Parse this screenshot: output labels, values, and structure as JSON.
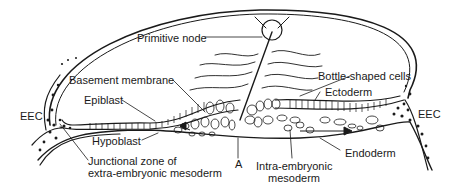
{
  "diagram": {
    "type": "embryo cross-section (gastrulation)",
    "ink_color": "#1a1a1a",
    "background": "#ffffff",
    "labels": {
      "primitive_node": "Primitive node",
      "basement_membrane": "Basement membrane",
      "bottle_shaped_cells": "Bottle-shaped cells",
      "ectoderm": "Ectoderm",
      "epiblast": "Epiblast",
      "eec_left": "EEC",
      "eec_right": "EEC",
      "hypoblast": "Hypoblast",
      "junctional_zone_line1": "Junctional zone of",
      "junctional_zone_line2": "extra-embryonic mesoderm",
      "a_marker": "A",
      "intra_embryonic_line1": "Intra-embryonic",
      "intra_embryonic_line2": "mesoderm",
      "endoderm": "Endoderm"
    }
  }
}
